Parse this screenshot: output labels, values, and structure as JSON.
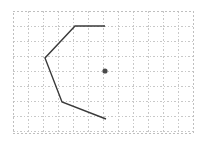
{
  "figure": {
    "width": 203,
    "height": 144,
    "background": "#ffffff"
  },
  "chart_data": {
    "type": "line",
    "title": "",
    "subtitle": "",
    "xlabel": "",
    "ylabel": "",
    "legend": [],
    "annotations": [],
    "grid": true,
    "grid_style": "dashed",
    "grid_color": "#c8c8c8",
    "grid_spacing": 15,
    "axis_ticks_visible": false,
    "tick_labels_x": [],
    "tick_labels_y": [],
    "xlim": [
      0,
      12
    ],
    "ylim": [
      0,
      8
    ],
    "plot_area": {
      "x": 13,
      "y": 11,
      "width": 180,
      "height": 122
    },
    "frame_color": "#bfbfbf",
    "series": [
      {
        "name": "polyline",
        "type": "line",
        "color": "#3a3a3a",
        "line_width": 1.4,
        "closed": false,
        "points": [
          {
            "x": 105,
            "y": 26
          },
          {
            "x": 75,
            "y": 26
          },
          {
            "x": 45,
            "y": 58
          },
          {
            "x": 62,
            "y": 102
          },
          {
            "x": 106,
            "y": 119
          }
        ]
      },
      {
        "name": "center-point",
        "type": "scatter",
        "color": "#4a4a4a",
        "marker": "circle",
        "marker_size": 2.6,
        "points": [
          {
            "x": 105,
            "y": 71
          }
        ]
      }
    ]
  }
}
